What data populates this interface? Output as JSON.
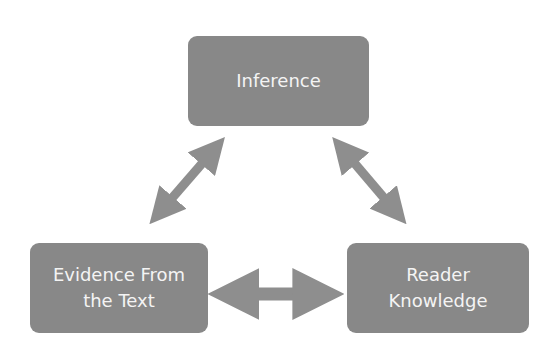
{
  "diagram": {
    "nodes": [
      {
        "id": "inference",
        "lines": [
          "Inference"
        ]
      },
      {
        "id": "evidence",
        "lines": [
          "Evidence From",
          "the Text"
        ]
      },
      {
        "id": "knowledge",
        "lines": [
          "Reader",
          "Knowledge"
        ]
      }
    ],
    "edges": [
      {
        "from": "inference",
        "to": "evidence",
        "type": "bidirectional"
      },
      {
        "from": "inference",
        "to": "knowledge",
        "type": "bidirectional"
      },
      {
        "from": "evidence",
        "to": "knowledge",
        "type": "bidirectional"
      }
    ],
    "colors": {
      "box": "#888888",
      "arrow": "#8e8e8e",
      "text": "#f4f4f4"
    }
  }
}
